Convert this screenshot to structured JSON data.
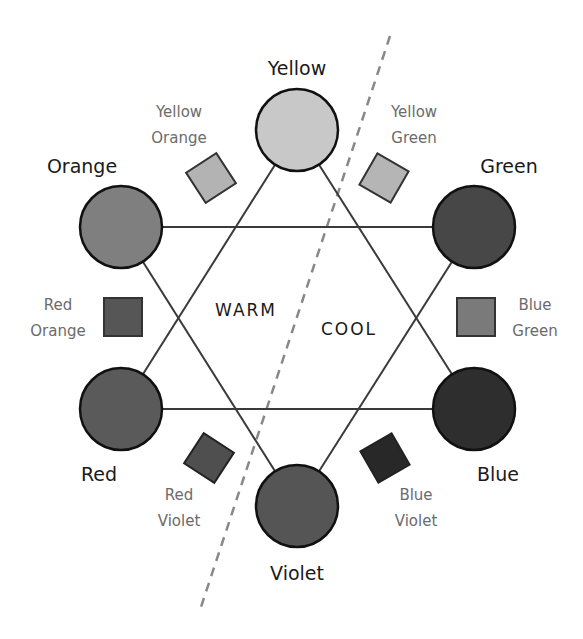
{
  "diagram": {
    "zones": {
      "warm": "WARM",
      "cool": "COOL"
    },
    "primary": [
      {
        "id": "yellow",
        "label": "Yellow",
        "fill": "#c8c8c8"
      },
      {
        "id": "orange",
        "label": "Orange",
        "fill": "#7f7f7f"
      },
      {
        "id": "green",
        "label": "Green",
        "fill": "#474747"
      },
      {
        "id": "red",
        "label": "Red",
        "fill": "#5a5a5a"
      },
      {
        "id": "blue",
        "label": "Blue",
        "fill": "#2e2e2e"
      },
      {
        "id": "violet",
        "label": "Violet",
        "fill": "#555555"
      }
    ],
    "secondary": [
      {
        "id": "yellow-orange",
        "line1": "Yellow",
        "line2": "Orange",
        "fill": "#b3b3b3"
      },
      {
        "id": "yellow-green",
        "line1": "Yellow",
        "line2": "Green",
        "fill": "#b5b5b5"
      },
      {
        "id": "red-orange",
        "line1": "Red",
        "line2": "Orange",
        "fill": "#565656"
      },
      {
        "id": "blue-green",
        "line1": "Blue",
        "line2": "Green",
        "fill": "#7a7a7a"
      },
      {
        "id": "red-violet",
        "line1": "Red",
        "line2": "Violet",
        "fill": "#4f4f4f"
      },
      {
        "id": "blue-violet",
        "line1": "Blue",
        "line2": "Violet",
        "fill": "#282828"
      }
    ]
  }
}
